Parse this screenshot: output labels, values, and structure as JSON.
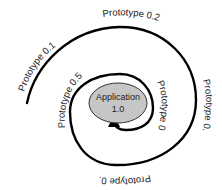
{
  "diagram": {
    "type": "spiral-prototyping",
    "center": {
      "line1": "Application",
      "line2": "1.0",
      "fill": "#c6c6c6",
      "stroke": "#333333"
    },
    "stages": [
      {
        "label": "Prototype 0.1"
      },
      {
        "label": "Prototype 0.2"
      },
      {
        "label": "Prototype 0.3"
      },
      {
        "label": "Prototype 0.4"
      },
      {
        "label": "Prototype 0.5"
      },
      {
        "label": "Prototype 0.6"
      }
    ],
    "line_color": "#000000"
  }
}
